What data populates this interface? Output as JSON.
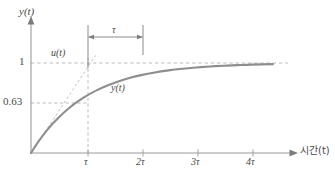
{
  "chart_data": {
    "type": "line",
    "title": "",
    "subtitle": "",
    "xlabel": "시간(t)",
    "ylabel": "y(t)",
    "xlim": [
      0,
      5
    ],
    "ylim": [
      0,
      1.18
    ],
    "grid": false,
    "legend_position": "inline-annotation",
    "x_tick_labels": [
      "τ",
      "2τ",
      "3τ",
      "4τ"
    ],
    "x_tick_values": [
      1,
      2,
      3,
      4
    ],
    "y_tick_labels": [
      "0.63",
      "1"
    ],
    "y_tick_values": [
      0.63,
      1
    ],
    "equation": "y(t) = 1 - e^(-t/τ)",
    "series": [
      {
        "name": "y(t)",
        "style": "solid",
        "color": "#8e8e8e",
        "x": [
          0,
          0.1,
          0.2,
          0.3,
          0.4,
          0.5,
          0.6,
          0.7,
          0.8,
          0.9,
          1.0,
          1.2,
          1.4,
          1.6,
          1.8,
          2.0,
          2.25,
          2.5,
          2.75,
          3.0,
          3.25,
          3.5,
          3.75,
          4.0,
          4.4
        ],
        "values": [
          0,
          0.095,
          0.181,
          0.259,
          0.33,
          0.393,
          0.451,
          0.503,
          0.551,
          0.593,
          0.632,
          0.699,
          0.753,
          0.798,
          0.835,
          0.865,
          0.895,
          0.918,
          0.936,
          0.95,
          0.961,
          0.97,
          0.976,
          0.982,
          0.988
        ]
      },
      {
        "name": "u(t)",
        "style": "dashed",
        "color": "#b4b4b4",
        "x": [
          0,
          1
        ],
        "values": [
          0,
          1
        ]
      }
    ],
    "asymptote": {
      "value": 1,
      "style": "dashed",
      "color": "#b4b4b4"
    },
    "annotations": [
      {
        "name": "curve-label",
        "text": "y(t)",
        "x": 1.55,
        "y": 0.52
      },
      {
        "name": "input-label",
        "text": "u(t)",
        "x": 0.42,
        "y": 1.09
      },
      {
        "name": "time-constant-span",
        "text": "τ",
        "from_x": 1,
        "to_x": 2,
        "y": 1.15
      }
    ],
    "guide_lines": [
      {
        "name": "y-one-dashed",
        "orientation": "horizontal",
        "value": 1
      },
      {
        "name": "y-063-dashed",
        "orientation": "horizontal",
        "value": 0.63
      },
      {
        "name": "t-tau-dashed",
        "orientation": "vertical",
        "value": 1
      }
    ]
  },
  "labels": {
    "y_axis": "y(t)",
    "x_axis": "시간(t)",
    "value_one": "1",
    "value_063": "0.63",
    "input_signal": "u(t)",
    "output_signal": "y(t)",
    "tau_annotation": "τ",
    "tick_tau": "τ",
    "tick_2tau": "2τ",
    "tick_3tau": "3τ",
    "tick_4tau": "4τ"
  },
  "colors": {
    "background": "#ffffff",
    "axis": "#9a9a9a",
    "curve": "#8e8e8e",
    "dashed": "#b4b4b4",
    "text": "#4a4a4a",
    "annotation": "#6e6e6e"
  }
}
